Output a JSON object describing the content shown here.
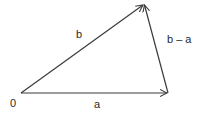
{
  "diagram": {
    "type": "vector-triangle",
    "points": {
      "origin": {
        "x": 21,
        "y": 93
      },
      "a_tip": {
        "x": 168,
        "y": 93
      },
      "b_tip": {
        "x": 144,
        "y": 4
      }
    },
    "vectors": [
      {
        "name": "a",
        "from": "origin",
        "to": "a_tip"
      },
      {
        "name": "b",
        "from": "origin",
        "to": "b_tip"
      },
      {
        "name": "b - a",
        "from": "a_tip",
        "to": "b_tip"
      }
    ],
    "labels": {
      "origin": "0",
      "a": "a",
      "b": "b",
      "b_minus_a": "b – a"
    },
    "colors": {
      "stroke": "#3a3a3a",
      "text": "#2a2a2a",
      "background": "#ffffff"
    }
  }
}
